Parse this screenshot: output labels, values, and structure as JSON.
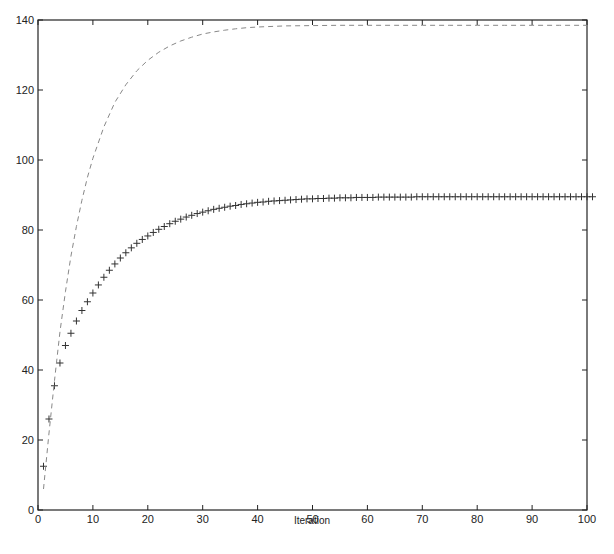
{
  "chart_data": {
    "type": "line",
    "title": "",
    "xlabel": "Iteration",
    "ylabel": "",
    "xlim": [
      0,
      100
    ],
    "ylim": [
      0,
      140
    ],
    "xticks": [
      0,
      10,
      20,
      30,
      40,
      50,
      60,
      70,
      80,
      90,
      100
    ],
    "yticks": [
      0,
      20,
      40,
      60,
      80,
      100,
      120,
      140
    ],
    "grid": false,
    "legend": null,
    "series": [
      {
        "name": "plus-marker series",
        "style": "markers '+'",
        "color": "#333333",
        "x": [
          1,
          2,
          3,
          4,
          5,
          6,
          7,
          8,
          9,
          10,
          11,
          12,
          13,
          14,
          15,
          16,
          17,
          18,
          19,
          20,
          21,
          22,
          23,
          24,
          25,
          26,
          27,
          28,
          29,
          30,
          31,
          32,
          33,
          34,
          35,
          36,
          37,
          38,
          39,
          40,
          41,
          42,
          43,
          44,
          45,
          46,
          47,
          48,
          49,
          50,
          51,
          52,
          53,
          54,
          55,
          56,
          57,
          58,
          59,
          60,
          61,
          62,
          63,
          64,
          65,
          66,
          67,
          68,
          69,
          70,
          71,
          72,
          73,
          74,
          75,
          76,
          77,
          78,
          79,
          80,
          81,
          82,
          83,
          84,
          85,
          86,
          87,
          88,
          89,
          90,
          91,
          92,
          93,
          94,
          95,
          96,
          97,
          98,
          99,
          100,
          101
        ],
        "values": [
          12.5,
          26,
          35.5,
          42,
          47,
          50.5,
          54,
          57,
          59.5,
          62,
          64.3,
          66.5,
          68.5,
          70.3,
          72,
          73.5,
          74.9,
          76.2,
          77.3,
          78.3,
          79.3,
          80.2,
          81,
          81.8,
          82.5,
          83.1,
          83.7,
          84.2,
          84.7,
          85.1,
          85.5,
          85.9,
          86.2,
          86.5,
          86.8,
          87,
          87.3,
          87.5,
          87.7,
          87.9,
          88,
          88.2,
          88.3,
          88.4,
          88.5,
          88.6,
          88.7,
          88.8,
          88.9,
          88.9,
          89,
          89,
          89.1,
          89.1,
          89.2,
          89.2,
          89.2,
          89.3,
          89.3,
          89.3,
          89.3,
          89.4,
          89.4,
          89.4,
          89.4,
          89.4,
          89.4,
          89.4,
          89.5,
          89.5,
          89.5,
          89.5,
          89.5,
          89.5,
          89.5,
          89.5,
          89.5,
          89.5,
          89.5,
          89.5,
          89.5,
          89.5,
          89.5,
          89.5,
          89.5,
          89.5,
          89.5,
          89.5,
          89.5,
          89.5,
          89.5,
          89.5,
          89.5,
          89.5,
          89.5,
          89.5,
          89.5,
          89.5,
          89.5,
          89.5,
          89.5
        ]
      },
      {
        "name": "dashed series",
        "style": "dashed line",
        "color": "#888888",
        "x": [
          1,
          2,
          3,
          4,
          5,
          6,
          7,
          8,
          9,
          10,
          12,
          14,
          16,
          18,
          20,
          22,
          24,
          26,
          28,
          30,
          32,
          34,
          36,
          38,
          40,
          45,
          50,
          55,
          60,
          65,
          70,
          75,
          80,
          85,
          90,
          95,
          100
        ],
        "values": [
          6,
          22,
          37,
          51,
          62.5,
          72.5,
          81,
          88.5,
          95,
          100.5,
          109.5,
          116.5,
          121.5,
          125.5,
          128.5,
          130.8,
          132.6,
          134,
          135.1,
          136,
          136.6,
          137.1,
          137.5,
          137.8,
          138,
          138.3,
          138.4,
          138.5,
          138.5,
          138.5,
          138.5,
          138.5,
          138.5,
          138.5,
          138.5,
          138.5,
          138.5
        ]
      }
    ]
  }
}
